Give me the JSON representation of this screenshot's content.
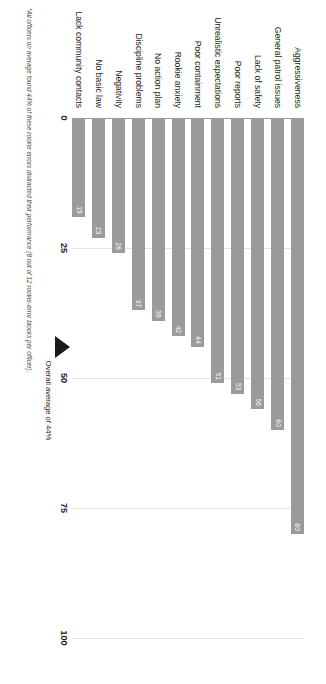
{
  "chart_data": {
    "type": "bar",
    "orientation": "horizontal",
    "title": "",
    "subtitle": "",
    "xlabel": "",
    "ylabel": "",
    "xlim": [
      0,
      100
    ],
    "grid": true,
    "legend": "none",
    "categories": [
      "Aggressiveness",
      "General patrol issues",
      "Lack of safety",
      "Poor reports",
      "Unrealistic expectations",
      "Poor containment",
      "Rookie anxiety",
      "No action plan",
      "Discipline problems",
      "Negativity",
      "No basic law",
      "Lack community contacts"
    ],
    "values": [
      80,
      60,
      56,
      53,
      51,
      44,
      42,
      39,
      37,
      26,
      23,
      19
    ],
    "tick_labels": [
      "0",
      "25",
      "50",
      "75",
      "100"
    ],
    "tick_values": [
      0,
      25,
      50,
      75,
      100
    ],
    "annotations": [
      {
        "name": "overall-average",
        "label": "Overall average of 44%",
        "value": 44
      }
    ],
    "footnote": "*All officers on average found 44% of these rookie errors distracted their performance (8 out of 12 rookie-error blocks per officer).",
    "colors": {
      "bar": "#9b9b9b",
      "value_label": "#ffffff",
      "gridline": "#e3e3e3",
      "axis": "#9a9a9a",
      "marker": "#1a1a1a",
      "text": "#231f20",
      "background": "#ffffff"
    }
  }
}
